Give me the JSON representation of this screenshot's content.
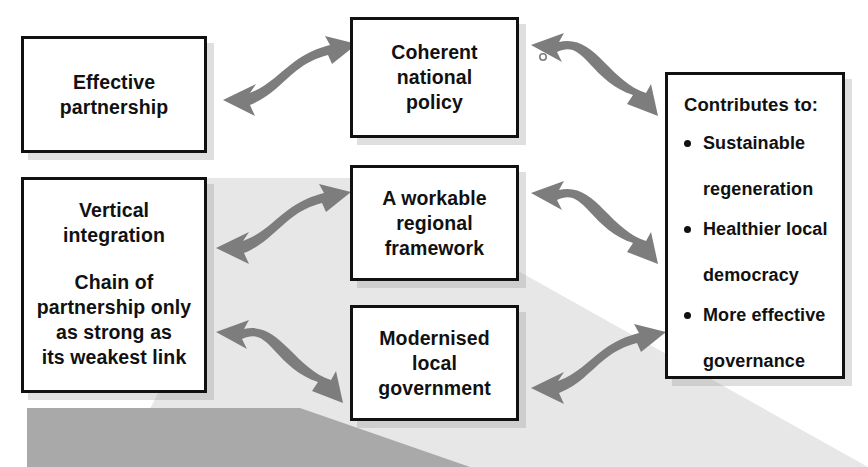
{
  "diagram": {
    "type": "relationship-flow-diagram",
    "background_color": "#ffffff",
    "box_border_color": "#111111",
    "arrow_color": "#7d7d7d",
    "band_light_color": "#e6e6e6",
    "band_dark_color": "#a8a8a8",
    "nodes": {
      "effective_partnership": {
        "lines": [
          "Effective",
          "partnership"
        ]
      },
      "coherent_national_policy": {
        "lines": [
          "Coherent",
          "national",
          "policy"
        ]
      },
      "vertical_integration": {
        "lines_top": [
          "Vertical",
          "integration"
        ],
        "lines_bottom": [
          "Chain of",
          "partnership only",
          "as strong as",
          "its weakest link"
        ]
      },
      "workable_regional_framework": {
        "lines": [
          "A workable",
          "regional",
          "framework"
        ]
      },
      "modernised_local_government": {
        "lines": [
          "Modernised",
          "local",
          "government"
        ]
      },
      "contributes": {
        "heading": "Contributes to:",
        "items": [
          {
            "lines": [
              "Sustainable",
              "regeneration"
            ]
          },
          {
            "lines": [
              "Healthier local",
              "democracy"
            ]
          },
          {
            "lines": [
              "More effective",
              "governance"
            ]
          }
        ]
      }
    },
    "connectors": [
      {
        "name": "effective-partnership-to-coherent-national-policy",
        "style": "double-headed-s-curve"
      },
      {
        "name": "coherent-national-policy-to-contributes",
        "style": "double-headed-s-curve"
      },
      {
        "name": "vertical-integration-to-workable-regional-framework",
        "style": "double-headed-s-curve"
      },
      {
        "name": "workable-regional-framework-to-contributes",
        "style": "double-headed-s-curve"
      },
      {
        "name": "vertical-integration-to-modernised-local-government",
        "style": "double-headed-s-curve"
      },
      {
        "name": "modernised-local-government-to-contributes",
        "style": "double-headed-s-curve"
      }
    ]
  }
}
